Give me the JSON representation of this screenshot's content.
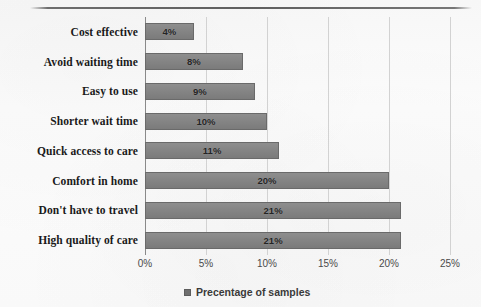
{
  "chart_data": {
    "type": "bar",
    "orientation": "horizontal",
    "title": "",
    "xlabel": "",
    "ylabel": "",
    "xlim": [
      0,
      25
    ],
    "xtick_labels": [
      "0%",
      "5%",
      "10%",
      "15%",
      "20%",
      "25%"
    ],
    "xticks": [
      0,
      5,
      10,
      15,
      20,
      25
    ],
    "grid": true,
    "legend": {
      "position": "bottom-center",
      "entries": [
        {
          "label": "Precentage of samples",
          "color": "#858585"
        }
      ]
    },
    "series": [
      {
        "name": "Precentage of samples",
        "color": "#858585",
        "values": [
          4,
          8,
          9,
          10,
          11,
          20,
          21,
          21
        ],
        "value_labels": [
          "4%",
          "8%",
          "9%",
          "10%",
          "11%",
          "20%",
          "21%",
          "21%"
        ]
      }
    ],
    "categories": [
      "Cost effective",
      "Avoid waiting time",
      "Easy to use",
      "Shorter wait time",
      "Quick access to care",
      "Comfort in home",
      "Don't have to travel",
      "High quality of care"
    ]
  },
  "colors": {
    "bar_fill": "#858585",
    "bar_border": "#6a6a6a",
    "gridline": "#d2d2d2",
    "axis": "#8a8a8a",
    "background": "#fbfbfb",
    "label_text": "#1a1a1a",
    "tick_text": "#4a4a4a"
  }
}
